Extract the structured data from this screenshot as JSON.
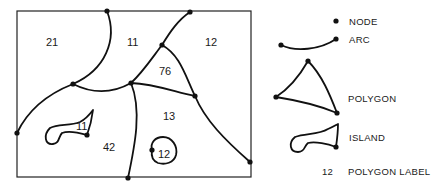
{
  "map": {
    "polygon_labels": [
      {
        "id": "p21",
        "text": "21",
        "x": 53,
        "y": 46
      },
      {
        "id": "p11-top",
        "text": "11",
        "x": 133,
        "y": 46
      },
      {
        "id": "p12-right",
        "text": "12",
        "x": 212,
        "y": 46
      },
      {
        "id": "p76",
        "text": "76",
        "x": 165,
        "y": 74
      },
      {
        "id": "p13",
        "text": "13",
        "x": 169,
        "y": 119
      },
      {
        "id": "p11-island",
        "text": "11",
        "x": 82,
        "y": 129
      },
      {
        "id": "p42",
        "text": "42",
        "x": 110,
        "y": 150
      },
      {
        "id": "p12-island",
        "text": "12",
        "x": 165,
        "y": 157
      }
    ]
  },
  "legend": {
    "node_label": "NODE",
    "arc_label": "ARC",
    "polygon_label": "POLYGON",
    "island_label": "ISLAND",
    "polygon_label_example_number": "12",
    "polygon_label_text": "POLYGON LABEL"
  },
  "colors": {
    "line": "#111111",
    "background": "#ffffff"
  }
}
